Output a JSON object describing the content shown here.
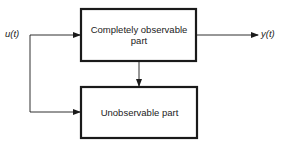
{
  "diagram": {
    "input_signal": "u(t)",
    "output_signal": "y(t)",
    "blocks": [
      {
        "id": "observable",
        "label": "Completely observable part"
      },
      {
        "id": "unobservable",
        "label": "Unobservable part"
      }
    ],
    "connections": [
      {
        "from": "u(t)",
        "to": "observable"
      },
      {
        "from": "u(t)",
        "to": "unobservable"
      },
      {
        "from": "observable",
        "to": "unobservable"
      },
      {
        "from": "observable",
        "to": "y(t)"
      }
    ],
    "colors": {
      "stroke": "#1a1a1a",
      "background": "#ffffff"
    }
  }
}
